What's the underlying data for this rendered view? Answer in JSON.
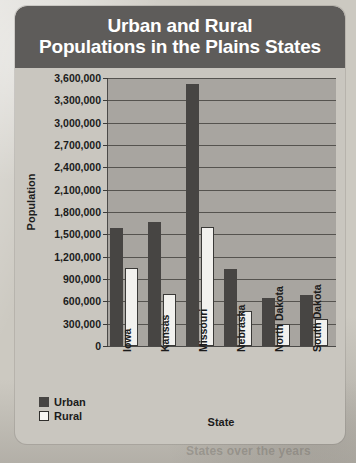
{
  "card": {
    "title_line_1": "Urban and Rural",
    "title_line_2": "Populations in the Plains States"
  },
  "background_text": {
    "line_1": "e methods and to l",
    "line_2": "saw decrease none of the change that",
    "line_3": "States over the years",
    "line_4": "Y"
  },
  "chart_data": {
    "type": "bar",
    "title": "Urban and Rural Populations in the Plains States",
    "xlabel": "State",
    "ylabel": "Population",
    "categories": [
      "Iowa",
      "Kansas",
      "Missouri",
      "Nebraska",
      "North Dakota",
      "South Dakota"
    ],
    "series": [
      {
        "name": "Urban",
        "color": "#474543",
        "values": [
          1580000,
          1670000,
          3520000,
          1030000,
          640000,
          690000
        ]
      },
      {
        "name": "Rural",
        "color": "#f2f1ee",
        "values": [
          1050000,
          700000,
          1600000,
          470000,
          290000,
          360000
        ]
      }
    ],
    "ylim": [
      0,
      3600000
    ],
    "ytick_step": 300000,
    "ytick_labels": [
      "3,600,000",
      "3,300,000",
      "3,000,000",
      "2,700,000",
      "2,400,000",
      "2,100,000",
      "1,800,000",
      "1,500,000",
      "1,200,000",
      "900,000",
      "600,000",
      "300,000",
      "0"
    ],
    "ytick_values": [
      3600000,
      3300000,
      3000000,
      2700000,
      2400000,
      2100000,
      1800000,
      1500000,
      1200000,
      900000,
      600000,
      300000,
      0
    ],
    "grid": true,
    "legend_position": "below-left",
    "legend": [
      "Urban",
      "Rural"
    ]
  }
}
